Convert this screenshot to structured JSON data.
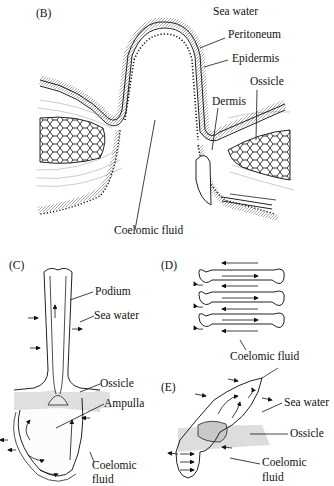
{
  "panels": {
    "B": {
      "label": "(B)",
      "annotations": {
        "sea_water": "Sea water",
        "peritoneum": "Peritoneum",
        "epidermis": "Epidermis",
        "ossicle": "Ossicle",
        "dermis": "Dermis",
        "coelomic_fluid": "Coelomic fluid"
      }
    },
    "C": {
      "label": "(C)",
      "annotations": {
        "podium": "Podium",
        "sea_water": "Sea water",
        "ossicle": "Ossicle",
        "ampulla": "Ampulla",
        "coelomic_fluid_line1": "Coelomic",
        "coelomic_fluid_line2": "fluid"
      }
    },
    "D": {
      "label": "(D)",
      "annotations": {
        "coelomic_fluid": "Coelomic fluid"
      }
    },
    "E": {
      "label": "(E)",
      "annotations": {
        "sea_water": "Sea water",
        "ossicle": "Ossicle",
        "coelomic_fluid_line1": "Coelomic",
        "coelomic_fluid_line2": "fluid"
      }
    }
  }
}
